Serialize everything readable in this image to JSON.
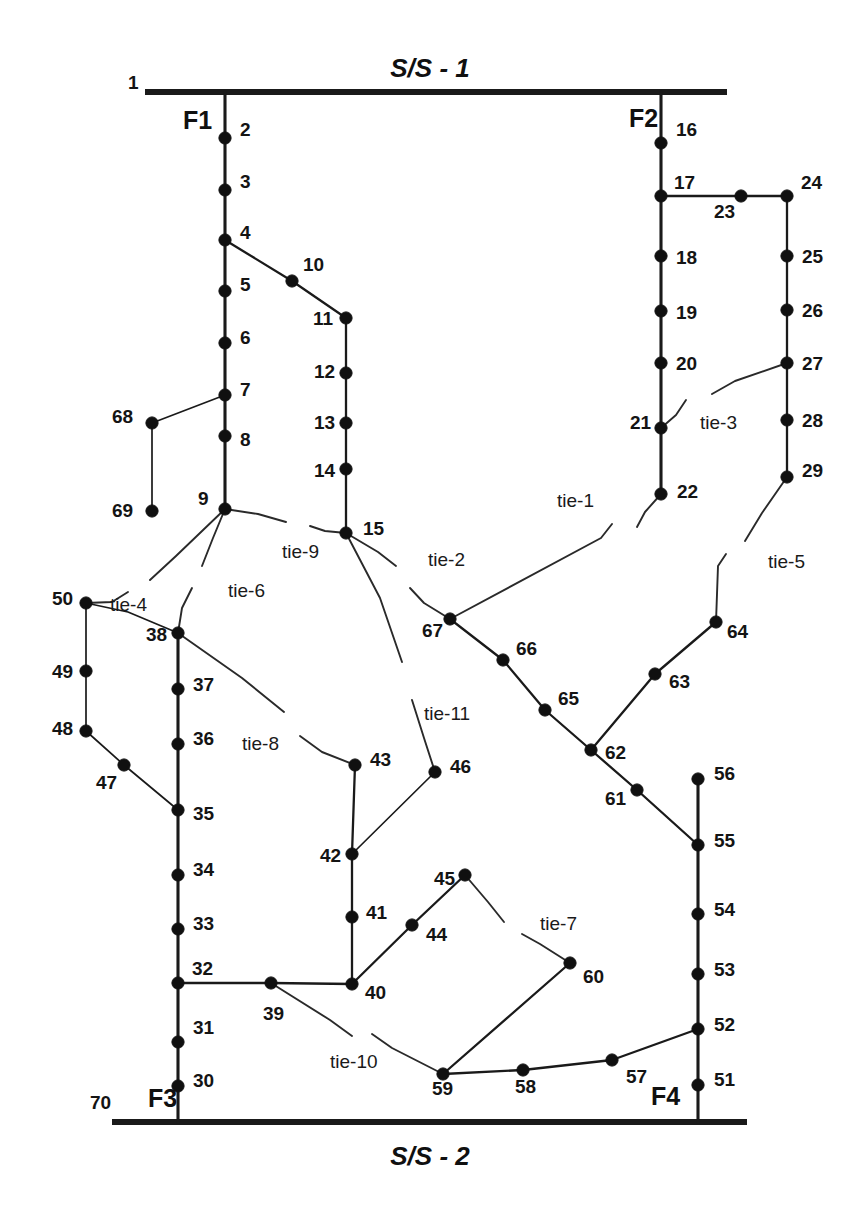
{
  "diagram": {
    "substations": [
      {
        "id": "ss1",
        "label": "S/S - 1",
        "x": 430,
        "y": 70,
        "bar_x1": 145,
        "bar_x2": 727,
        "bar_y": 92
      },
      {
        "id": "ss2",
        "label": "S/S - 2",
        "x": 430,
        "y": 1158,
        "bar_x1": 112,
        "bar_x2": 747,
        "bar_y": 1122
      }
    ],
    "feeders": [
      {
        "id": "F1",
        "label": "F1",
        "x": 183,
        "y": 122,
        "trunk_x": 225,
        "source": "ss1"
      },
      {
        "id": "F2",
        "label": "F2",
        "x": 629,
        "y": 120,
        "trunk_x": 661,
        "source": "ss1"
      },
      {
        "id": "F3",
        "label": "F3",
        "x": 148,
        "y": 1100,
        "trunk_x": 178,
        "source": "ss2"
      },
      {
        "id": "F4",
        "label": "F4",
        "x": 651,
        "y": 1098,
        "trunk_x": 698,
        "source": "ss2"
      }
    ],
    "ties": [
      {
        "name": "tie-1",
        "from": 22,
        "to": 67,
        "label_x": 557,
        "label_y": 502
      },
      {
        "name": "tie-2",
        "from": 15,
        "to": 67,
        "label_x": 428,
        "label_y": 561
      },
      {
        "name": "tie-3",
        "from": 21,
        "to": 27,
        "label_x": 700,
        "label_y": 424
      },
      {
        "name": "tie-4",
        "from": 9,
        "to": 50,
        "label_x": 110,
        "label_y": 606
      },
      {
        "name": "tie-5",
        "from": 29,
        "to": 64,
        "label_x": 768,
        "label_y": 563
      },
      {
        "name": "tie-6",
        "from": 9,
        "to": 38,
        "label_x": 228,
        "label_y": 592
      },
      {
        "name": "tie-7",
        "from": 45,
        "to": 60,
        "label_x": 540,
        "label_y": 925
      },
      {
        "name": "tie-8",
        "from": 38,
        "to": 43,
        "label_x": 242,
        "label_y": 745
      },
      {
        "name": "tie-9",
        "from": 9,
        "to": 15,
        "label_x": 282,
        "label_y": 553
      },
      {
        "name": "tie-10",
        "from": 39,
        "to": 59,
        "label_x": 330,
        "label_y": 1063
      },
      {
        "name": "tie-11",
        "from": 15,
        "to": 46,
        "label_x": 424,
        "label_y": 715
      }
    ],
    "nodes": [
      {
        "id": 1,
        "label": "1",
        "x": 145,
        "y": 92,
        "lx": 128,
        "ly": 84,
        "dot": false
      },
      {
        "id": 2,
        "label": "2",
        "x": 225,
        "y": 138,
        "lx": 240,
        "ly": 131
      },
      {
        "id": 3,
        "label": "3",
        "x": 225,
        "y": 190,
        "lx": 240,
        "ly": 183
      },
      {
        "id": 4,
        "label": "4",
        "x": 225,
        "y": 240,
        "lx": 240,
        "ly": 234
      },
      {
        "id": 5,
        "label": "5",
        "x": 225,
        "y": 291,
        "lx": 240,
        "ly": 286
      },
      {
        "id": 6,
        "label": "6",
        "x": 225,
        "y": 343,
        "lx": 240,
        "ly": 339
      },
      {
        "id": 7,
        "label": "7",
        "x": 225,
        "y": 395,
        "lx": 240,
        "ly": 391
      },
      {
        "id": 8,
        "label": "8",
        "x": 225,
        "y": 436,
        "lx": 240,
        "ly": 441
      },
      {
        "id": 9,
        "label": "9",
        "x": 225,
        "y": 509,
        "lx": 198,
        "ly": 500
      },
      {
        "id": 10,
        "label": "10",
        "x": 292,
        "y": 281,
        "lx": 303,
        "ly": 266
      },
      {
        "id": 11,
        "label": "11",
        "x": 346,
        "y": 318,
        "lx": 313,
        "ly": 320
      },
      {
        "id": 12,
        "label": "12",
        "x": 346,
        "y": 373,
        "lx": 314,
        "ly": 373
      },
      {
        "id": 13,
        "label": "13",
        "x": 346,
        "y": 423,
        "lx": 314,
        "ly": 424
      },
      {
        "id": 14,
        "label": "14",
        "x": 346,
        "y": 469,
        "lx": 314,
        "ly": 472
      },
      {
        "id": 15,
        "label": "15",
        "x": 346,
        "y": 533,
        "lx": 363,
        "ly": 530
      },
      {
        "id": 16,
        "label": "16",
        "x": 661,
        "y": 143,
        "lx": 676,
        "ly": 131
      },
      {
        "id": 17,
        "label": "17",
        "x": 661,
        "y": 196,
        "lx": 674,
        "ly": 184
      },
      {
        "id": 18,
        "label": "18",
        "x": 661,
        "y": 256,
        "lx": 676,
        "ly": 259
      },
      {
        "id": 19,
        "label": "19",
        "x": 661,
        "y": 311,
        "lx": 676,
        "ly": 314
      },
      {
        "id": 20,
        "label": "20",
        "x": 661,
        "y": 363,
        "lx": 676,
        "ly": 365
      },
      {
        "id": 21,
        "label": "21",
        "x": 661,
        "y": 428,
        "lx": 630,
        "ly": 424
      },
      {
        "id": 22,
        "label": "22",
        "x": 661,
        "y": 494,
        "lx": 677,
        "ly": 493
      },
      {
        "id": 23,
        "label": "23",
        "x": 741,
        "y": 196,
        "lx": 714,
        "ly": 213
      },
      {
        "id": 24,
        "label": "24",
        "x": 787,
        "y": 196,
        "lx": 801,
        "ly": 184
      },
      {
        "id": 25,
        "label": "25",
        "x": 787,
        "y": 256,
        "lx": 802,
        "ly": 258
      },
      {
        "id": 26,
        "label": "26",
        "x": 787,
        "y": 310,
        "lx": 802,
        "ly": 312
      },
      {
        "id": 27,
        "label": "27",
        "x": 787,
        "y": 363,
        "lx": 802,
        "ly": 365
      },
      {
        "id": 28,
        "label": "28",
        "x": 787,
        "y": 420,
        "lx": 802,
        "ly": 422
      },
      {
        "id": 29,
        "label": "29",
        "x": 787,
        "y": 477,
        "lx": 802,
        "ly": 472
      },
      {
        "id": 30,
        "label": "30",
        "x": 178,
        "y": 1086,
        "lx": 193,
        "ly": 1082
      },
      {
        "id": 31,
        "label": "31",
        "x": 178,
        "y": 1042,
        "lx": 193,
        "ly": 1029
      },
      {
        "id": 32,
        "label": "32",
        "x": 178,
        "y": 983,
        "lx": 192,
        "ly": 970
      },
      {
        "id": 33,
        "label": "33",
        "x": 178,
        "y": 929,
        "lx": 193,
        "ly": 925
      },
      {
        "id": 34,
        "label": "34",
        "x": 178,
        "y": 875,
        "lx": 193,
        "ly": 871
      },
      {
        "id": 35,
        "label": "35",
        "x": 178,
        "y": 810,
        "lx": 193,
        "ly": 815
      },
      {
        "id": 36,
        "label": "36",
        "x": 178,
        "y": 744,
        "lx": 193,
        "ly": 740
      },
      {
        "id": 37,
        "label": "37",
        "x": 178,
        "y": 689,
        "lx": 193,
        "ly": 686
      },
      {
        "id": 38,
        "label": "38",
        "x": 178,
        "y": 633,
        "lx": 146,
        "ly": 636
      },
      {
        "id": 39,
        "label": "39",
        "x": 271,
        "y": 983,
        "lx": 263,
        "ly": 1015
      },
      {
        "id": 40,
        "label": "40",
        "x": 352,
        "y": 984,
        "lx": 365,
        "ly": 994
      },
      {
        "id": 41,
        "label": "41",
        "x": 352,
        "y": 917,
        "lx": 366,
        "ly": 914
      },
      {
        "id": 42,
        "label": "42",
        "x": 352,
        "y": 854,
        "lx": 320,
        "ly": 857
      },
      {
        "id": 43,
        "label": "43",
        "x": 355,
        "y": 765,
        "lx": 370,
        "ly": 761
      },
      {
        "id": 44,
        "label": "44",
        "x": 412,
        "y": 925,
        "lx": 426,
        "ly": 936
      },
      {
        "id": 45,
        "label": "45",
        "x": 465,
        "y": 875,
        "lx": 434,
        "ly": 880
      },
      {
        "id": 46,
        "label": "46",
        "x": 435,
        "y": 772,
        "lx": 450,
        "ly": 768
      },
      {
        "id": 47,
        "label": "47",
        "x": 124,
        "y": 765,
        "lx": 96,
        "ly": 784
      },
      {
        "id": 48,
        "label": "48",
        "x": 86,
        "y": 731,
        "lx": 52,
        "ly": 730
      },
      {
        "id": 49,
        "label": "49",
        "x": 86,
        "y": 671,
        "lx": 52,
        "ly": 673
      },
      {
        "id": 50,
        "label": "50",
        "x": 86,
        "y": 603,
        "lx": 52,
        "ly": 600
      },
      {
        "id": 51,
        "label": "51",
        "x": 698,
        "y": 1085,
        "lx": 714,
        "ly": 1081
      },
      {
        "id": 52,
        "label": "52",
        "x": 698,
        "y": 1029,
        "lx": 714,
        "ly": 1026
      },
      {
        "id": 53,
        "label": "53",
        "x": 698,
        "y": 974,
        "lx": 714,
        "ly": 971
      },
      {
        "id": 54,
        "label": "54",
        "x": 698,
        "y": 914,
        "lx": 714,
        "ly": 911
      },
      {
        "id": 55,
        "label": "55",
        "x": 698,
        "y": 845,
        "lx": 714,
        "ly": 842
      },
      {
        "id": 56,
        "label": "56",
        "x": 698,
        "y": 779,
        "lx": 714,
        "ly": 775
      },
      {
        "id": 57,
        "label": "57",
        "x": 612,
        "y": 1060,
        "lx": 626,
        "ly": 1078
      },
      {
        "id": 58,
        "label": "58",
        "x": 523,
        "y": 1070,
        "lx": 515,
        "ly": 1088
      },
      {
        "id": 59,
        "label": "59",
        "x": 443,
        "y": 1074,
        "lx": 432,
        "ly": 1090
      },
      {
        "id": 60,
        "label": "60",
        "x": 570,
        "y": 963,
        "lx": 583,
        "ly": 978
      },
      {
        "id": 61,
        "label": "61",
        "x": 637,
        "y": 790,
        "lx": 605,
        "ly": 800
      },
      {
        "id": 62,
        "label": "62",
        "x": 591,
        "y": 750,
        "lx": 605,
        "ly": 754
      },
      {
        "id": 63,
        "label": "63",
        "x": 655,
        "y": 674,
        "lx": 669,
        "ly": 683
      },
      {
        "id": 64,
        "label": "64",
        "x": 716,
        "y": 622,
        "lx": 727,
        "ly": 633
      },
      {
        "id": 65,
        "label": "65",
        "x": 545,
        "y": 710,
        "lx": 558,
        "ly": 700
      },
      {
        "id": 66,
        "label": "66",
        "x": 503,
        "y": 660,
        "lx": 516,
        "ly": 650
      },
      {
        "id": 67,
        "label": "67",
        "x": 450,
        "y": 619,
        "lx": 422,
        "ly": 632
      },
      {
        "id": 68,
        "label": "68",
        "x": 152,
        "y": 423,
        "lx": 112,
        "ly": 418
      },
      {
        "id": 69,
        "label": "69",
        "x": 152,
        "y": 511,
        "lx": 112,
        "ly": 512
      },
      {
        "id": 70,
        "label": "70",
        "x": 112,
        "y": 1122,
        "lx": 90,
        "ly": 1104,
        "dot": false
      }
    ],
    "colors": {
      "line": "#1a1a1a",
      "node": "#101010",
      "background": "#ffffff",
      "label": "#141414"
    }
  }
}
